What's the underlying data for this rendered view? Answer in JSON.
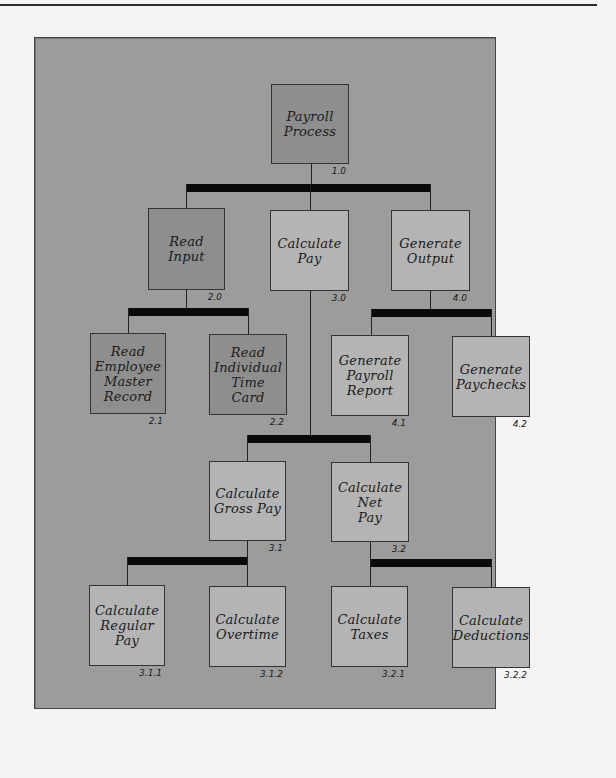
{
  "diagram": {
    "type": "hierarchy-chart",
    "colors": {
      "panel": "#9c9c9c",
      "node_dark": "#8e8e8e",
      "node_light": "#b4b4b4",
      "connector_bar": "#0a0a0a"
    },
    "nodes": {
      "n1_0": {
        "id": "1.0",
        "label": "Payroll\nProcess"
      },
      "n2_0": {
        "id": "2.0",
        "label": "Read\nInput"
      },
      "n3_0": {
        "id": "3.0",
        "label": "Calculate\nPay"
      },
      "n4_0": {
        "id": "4.0",
        "label": "Generate\nOutput"
      },
      "n2_1": {
        "id": "2.1",
        "label": "Read\nEmployee\nMaster\nRecord"
      },
      "n2_2": {
        "id": "2.2",
        "label": "Read\nIndividual\nTime\nCard"
      },
      "n4_1": {
        "id": "4.1",
        "label": "Generate\nPayroll\nReport"
      },
      "n4_2": {
        "id": "4.2",
        "label": "Generate\nPaychecks"
      },
      "n3_1": {
        "id": "3.1",
        "label": "Calculate\nGross Pay"
      },
      "n3_2": {
        "id": "3.2",
        "label": "Calculate\nNet\nPay"
      },
      "n3_1_1": {
        "id": "3.1.1",
        "label": "Calculate\nRegular\nPay"
      },
      "n3_1_2": {
        "id": "3.1.2",
        "label": "Calculate\nOvertime"
      },
      "n3_2_1": {
        "id": "3.2.1",
        "label": "Calculate\nTaxes"
      },
      "n3_2_2": {
        "id": "3.2.2",
        "label": "Calculate\nDeductions"
      }
    },
    "edges": [
      [
        "1.0",
        "2.0"
      ],
      [
        "1.0",
        "3.0"
      ],
      [
        "1.0",
        "4.0"
      ],
      [
        "2.0",
        "2.1"
      ],
      [
        "2.0",
        "2.2"
      ],
      [
        "4.0",
        "4.1"
      ],
      [
        "4.0",
        "4.2"
      ],
      [
        "3.0",
        "3.1"
      ],
      [
        "3.0",
        "3.2"
      ],
      [
        "3.1",
        "3.1.1"
      ],
      [
        "3.1",
        "3.1.2"
      ],
      [
        "3.2",
        "3.2.1"
      ],
      [
        "3.2",
        "3.2.2"
      ]
    ]
  }
}
